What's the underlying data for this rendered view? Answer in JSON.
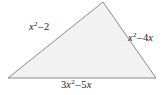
{
  "figure": {
    "type": "geometry-diagram",
    "shape_name": "triangle",
    "background_color": "#ffffff",
    "shape": {
      "fill_color": "#f2f2f2",
      "stroke_color": "#8a8a8a",
      "stroke_width": 1,
      "vertices": [
        {
          "name": "apex",
          "x": 103,
          "y": 2
        },
        {
          "name": "bottom-right",
          "x": 156,
          "y": 78
        },
        {
          "name": "bottom-left",
          "x": 8,
          "y": 78
        }
      ]
    },
    "labels": {
      "left_side": {
        "text": "x2 - 2",
        "base": "x",
        "exponent": "2",
        "operator": "–",
        "term": "2"
      },
      "right_side": {
        "text": "x2 - 4x",
        "base": "x",
        "exponent": "2",
        "operator": "–",
        "term": "4x",
        "term_coefficient": "4",
        "term_variable": "x"
      },
      "bottom_side": {
        "text": "3x2 - 5x",
        "coefficient": "3",
        "base": "x",
        "exponent": "2",
        "operator": "–",
        "term": "5x",
        "term_coefficient": "5",
        "term_variable": "x"
      }
    }
  }
}
